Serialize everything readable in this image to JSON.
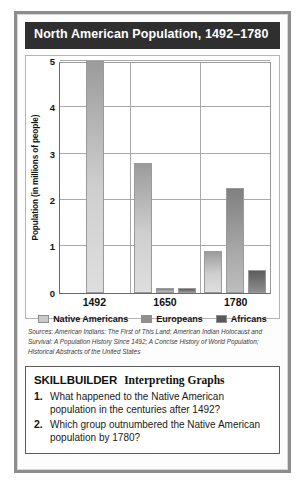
{
  "figure": {
    "title": "North American Population, 1492–1780"
  },
  "chart_data": {
    "type": "bar",
    "title": "North American Population, 1492–1780",
    "xlabel": "",
    "ylabel": "Population (in millions of people)",
    "ylim": [
      0,
      5
    ],
    "yticks": [
      "0",
      "1",
      "2",
      "3",
      "4",
      "5"
    ],
    "grid": true,
    "legend_position": "bottom",
    "categories": [
      "1492",
      "1650",
      "1780"
    ],
    "series": [
      {
        "name": "Native Americans",
        "values": [
          5.0,
          2.8,
          0.9
        ],
        "color": "#c9c9c9"
      },
      {
        "name": "Europeans",
        "values": [
          0,
          0.1,
          2.25
        ],
        "color": "#8f8f8f"
      },
      {
        "name": "Africans",
        "values": [
          0,
          0.1,
          0.5
        ],
        "color": "#5a5a5a"
      }
    ],
    "sources": "Sources: American Indians: The First of This Land; American Indian Holocaust and Survival: A Population History Since 1492; A Concise History of World Population; Historical Abstracts of the United States"
  },
  "skillbuilder": {
    "title": "SKILLBUILDER",
    "subtitle": "Interpreting Graphs",
    "questions": [
      {
        "number": "1.",
        "text": "What happened to the Native American population in the centuries after 1492?"
      },
      {
        "number": "2.",
        "text": "Which group outnumbered the Native American population by 1780?"
      }
    ]
  }
}
